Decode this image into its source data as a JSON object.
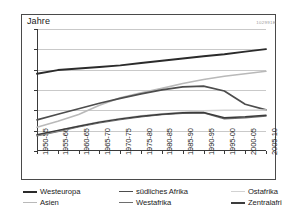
{
  "chart_data": {
    "type": "line",
    "title": "",
    "xlabel": "",
    "ylabel": "Jahre",
    "ylim": [
      30,
      90
    ],
    "yticks": [
      30,
      40,
      50,
      60,
      70,
      80,
      90
    ],
    "grid": true,
    "legend_position": "bottom",
    "watermark": "102991E",
    "categories": [
      "1950-55",
      "1955-60",
      "1960-65",
      "1965-70",
      "1970-75",
      "1975-80",
      "1980-85",
      "1985-90",
      "1990-95",
      "1995-00",
      "2000-05",
      "2005-10"
    ],
    "series": [
      {
        "name": "Westeuropa",
        "color": "#2b2b2b",
        "width": 1.9,
        "values": [
          68.0,
          69.8,
          70.6,
          71.3,
          72.1,
          73.3,
          74.4,
          75.5,
          76.6,
          77.6,
          78.9,
          80.1
        ]
      },
      {
        "name": "Asien",
        "color": "#b9b9b9",
        "width": 1.6,
        "values": [
          41.7,
          44.6,
          48.0,
          52.5,
          56.2,
          58.6,
          60.8,
          63.2,
          65.2,
          66.8,
          68.0,
          69.2
        ]
      },
      {
        "name": "südliches Afrika",
        "color": "#4d4d4d",
        "width": 1.7,
        "values": [
          45.3,
          48.1,
          50.8,
          53.5,
          55.9,
          58.1,
          60.1,
          61.5,
          61.9,
          59.5,
          53.0,
          50.2
        ]
      },
      {
        "name": "Westafrika",
        "color": "#6e6e6e",
        "width": 1.5,
        "values": [
          37.5,
          39.6,
          41.9,
          43.9,
          45.5,
          46.9,
          47.9,
          48.6,
          48.8,
          45.8,
          46.3,
          47.2
        ]
      },
      {
        "name": "Ostafrika",
        "color": "#d2d2d2",
        "width": 1.5,
        "values": [
          37.8,
          40.0,
          42.3,
          44.4,
          46.0,
          47.3,
          48.3,
          49.0,
          49.8,
          50.0,
          50.0,
          50.2
        ]
      },
      {
        "name": "Zentralafrika",
        "color": "#3c3c3c",
        "width": 1.5,
        "values": [
          38.0,
          40.1,
          42.2,
          44.2,
          45.8,
          47.1,
          48.1,
          48.8,
          48.9,
          46.4,
          46.8,
          47.6
        ]
      }
    ]
  },
  "axis": {
    "unit_label": "Jahre"
  },
  "legend": {
    "entries": [
      {
        "label": "Westeuropa",
        "color": "#2b2b2b",
        "width": 2.0
      },
      {
        "label": "südliches Afrika",
        "color": "#4d4d4d",
        "width": 1.8
      },
      {
        "label": "Ostafrika",
        "color": "#d2d2d2",
        "width": 1.6
      },
      {
        "label": "Asien",
        "color": "#b9b9b9",
        "width": 1.6
      },
      {
        "label": "Westafrika",
        "color": "#6e6e6e",
        "width": 1.6
      },
      {
        "label": "Zentralafrika",
        "color": "#3c3c3c",
        "width": 2.0
      }
    ]
  }
}
